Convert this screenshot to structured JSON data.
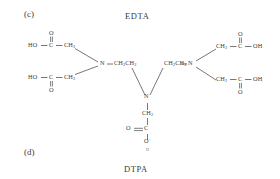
{
  "figure": {
    "panel_c": {
      "tag": "(c)",
      "name": "EDTA"
    },
    "panel_d": {
      "tag": "(d)",
      "name": "DTPA"
    }
  },
  "structure": {
    "arms": {
      "top_left": {
        "ho": "HO",
        "c": "C",
        "o": "O",
        "ch2": "CH",
        "ch2_sub": "2"
      },
      "bottom_left": {
        "ho": "HO",
        "c": "C",
        "o": "O",
        "ch2": "CH",
        "ch2_sub": "2"
      },
      "top_right": {
        "oh": "OH",
        "c": "C",
        "o": "O",
        "ch2": "CH",
        "ch2_sub": "2"
      },
      "bottom_right": {
        "oh": "OH",
        "c": "C",
        "o": "O",
        "ch2": "CH",
        "ch2_sub": "2"
      },
      "center_bottom": {
        "o_left": "O",
        "c": "C",
        "o_bottom": "O",
        "ch2": "CH",
        "ch2_sub": "2",
        "h": "H",
        "charge": "+"
      }
    },
    "nitrogens": {
      "left": "N",
      "center": "N",
      "right": "N"
    },
    "linkers": {
      "left_ethylene": "CH2CH2",
      "right_ethylene": "CH2CH2"
    },
    "labels": {
      "n_left": "N",
      "n_center": "N",
      "n_right": "N",
      "ch2ch2_left_html": "CH2CH2",
      "ch2ch2_right_html": "CH2CH2"
    }
  },
  "colors": {
    "background": "#ffffff",
    "ink": "#3d3d3d",
    "bond": "#4a4a4a"
  }
}
